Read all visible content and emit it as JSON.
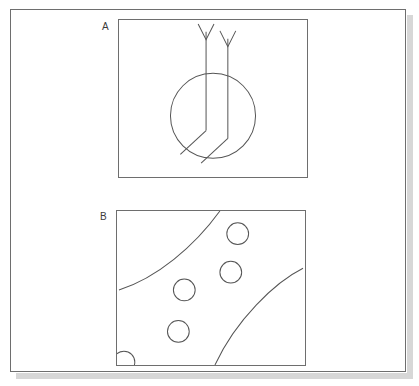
{
  "figure": {
    "background_color": "#ffffff",
    "stroke_color": "#555555",
    "frame_color": "#6e6e6e",
    "shadow_color": "#d7d7d7"
  },
  "panels": [
    {
      "label": "A",
      "name": "panel-a",
      "description": "Circle with two vertical lines entering from above, each tipped by a downward chevron arrowhead; inside the circle both lines bend diagonally toward the lower left.",
      "viewbox": "0 0 190 159",
      "shapes": {
        "circle": {
          "cx": 95,
          "cy": 97,
          "r": 43
        },
        "arrow_left": {
          "shaft": "M 88 12 L 88 112",
          "head": "M 80 4 L 88 20 L 96 4"
        },
        "arrow_right": {
          "shaft": "M 110 19 L 110 120",
          "head": "M 102 11 L 110 27 L 118 11"
        },
        "bend_left": "M 88 112 L 62 136",
        "bend_right": "M 110 120 L 83 145"
      }
    },
    {
      "label": "B",
      "name": "panel-b",
      "description": "Rectangular field crossed by two curved lines forming a diagonal band, scattered with five small circles, one clipped at the lower-left corner.",
      "viewbox": "0 0 190 156",
      "shapes": {
        "curve_upper": "M 2 80 C 40 68 78 36 104 0",
        "curve_lower": "M 99 156 C 120 110 160 72 188 58",
        "circles": [
          {
            "cx": 122,
            "cy": 23,
            "r": 11
          },
          {
            "cx": 115,
            "cy": 62,
            "r": 11
          },
          {
            "cx": 68,
            "cy": 80,
            "r": 11
          },
          {
            "cx": 62,
            "cy": 122,
            "r": 11
          },
          {
            "cx": 7,
            "cy": 153,
            "r": 11
          }
        ]
      }
    }
  ]
}
